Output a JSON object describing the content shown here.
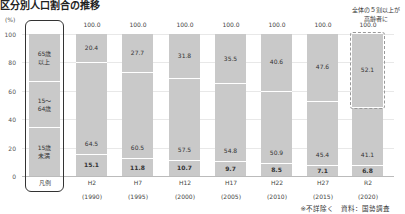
{
  "title": "区分別人口割合の推移",
  "unit_label": "(%)",
  "y_ticks": [
    "100",
    "80",
    "60",
    "40",
    "20",
    "0"
  ],
  "legend": {
    "label": "凡例",
    "top": "65歳\n以上",
    "mid": "15～\n64歳",
    "bottom": "15歳\n未満"
  },
  "annotation": "全体の５割以上が\n高齢者に",
  "note": "※不詳除く　資料：国勢調査",
  "bars": [
    {
      "era": "H2",
      "year": "(1990)",
      "total": "100.0",
      "top": "20.4",
      "mid": "64.5",
      "bottom": "15.1"
    },
    {
      "era": "H7",
      "year": "(1995)",
      "total": "100.0",
      "top": "27.7",
      "mid": "60.5",
      "bottom": "11.8"
    },
    {
      "era": "H12",
      "year": "(2000)",
      "total": "100.0",
      "top": "31.8",
      "mid": "57.5",
      "bottom": "10.7"
    },
    {
      "era": "H17",
      "year": "(2005)",
      "total": "100.0",
      "top": "35.5",
      "mid": "54.8",
      "bottom": "9.7"
    },
    {
      "era": "H22",
      "year": "(2010)",
      "total": "100.0",
      "top": "40.6",
      "mid": "50.9",
      "bottom": "8.5"
    },
    {
      "era": "H27",
      "year": "(2015)",
      "total": "100.0",
      "top": "47.6",
      "mid": "45.4",
      "bottom": "7.1"
    },
    {
      "era": "R2",
      "year": "(2020)",
      "total": "100.0",
      "top": "52.1",
      "mid": "41.1",
      "bottom": "6.8"
    }
  ],
  "chart_data": {
    "type": "bar",
    "stacked": true,
    "title": "区分別人口割合の推移",
    "ylabel": "(%)",
    "xlabel": "",
    "ylim": [
      0,
      100
    ],
    "grid": true,
    "categories": [
      "H2 (1990)",
      "H7 (1995)",
      "H12 (2000)",
      "H17 (2005)",
      "H22 (2010)",
      "H27 (2015)",
      "R2 (2020)"
    ],
    "series": [
      {
        "name": "15歳未満",
        "values": [
          15.1,
          11.8,
          10.7,
          9.7,
          8.5,
          7.1,
          6.8
        ]
      },
      {
        "name": "15～64歳",
        "values": [
          64.5,
          60.5,
          57.5,
          54.8,
          50.9,
          45.4,
          41.1
        ]
      },
      {
        "name": "65歳以上",
        "values": [
          20.4,
          27.7,
          31.8,
          35.5,
          40.6,
          47.6,
          52.1
        ]
      }
    ],
    "totals": [
      100.0,
      100.0,
      100.0,
      100.0,
      100.0,
      100.0,
      100.0
    ],
    "legend_position": "left (inline legend bar)",
    "annotations": [
      "全体の５割以上が高齢者に (R2 65歳以上 highlighted)",
      "※不詳除く　資料：国勢調査"
    ]
  }
}
